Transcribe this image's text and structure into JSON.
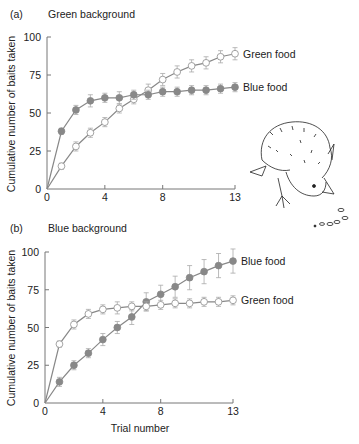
{
  "chart_data": [
    {
      "type": "line",
      "panel_label": "(a)",
      "title": "Green background",
      "xlabel": "",
      "ylabel": "Cumulative number of baits taken",
      "x": [
        0,
        1,
        2,
        3,
        4,
        5,
        6,
        7,
        8,
        9,
        10,
        11,
        12,
        13
      ],
      "xticks": [
        0,
        4,
        8,
        13
      ],
      "yticks": [
        0,
        25,
        50,
        75,
        100
      ],
      "xlim": [
        0,
        13
      ],
      "ylim": [
        0,
        100
      ],
      "grid": false,
      "series": [
        {
          "name": "Green food",
          "marker": "open-circle",
          "values": [
            0,
            15,
            28,
            37,
            44,
            53,
            59,
            65,
            72,
            77,
            81,
            83,
            87,
            89
          ],
          "error": [
            0,
            2,
            3,
            3,
            3,
            3,
            3,
            4,
            4,
            4,
            4,
            4,
            4,
            4
          ]
        },
        {
          "name": "Blue food",
          "marker": "filled-circle",
          "values": [
            0,
            38,
            52,
            58,
            60,
            60,
            62,
            62,
            64,
            64,
            65,
            65,
            66,
            67
          ],
          "error": [
            0,
            2,
            3,
            4,
            3,
            4,
            3,
            3,
            3,
            3,
            3,
            3,
            3,
            3
          ]
        }
      ],
      "legend": "inline-right"
    },
    {
      "type": "line",
      "panel_label": "(b)",
      "title": "Blue background",
      "xlabel": "Trial number",
      "ylabel": "Cumulative number of baits taken",
      "x": [
        0,
        1,
        2,
        3,
        4,
        5,
        6,
        7,
        8,
        9,
        10,
        11,
        12,
        13
      ],
      "xticks": [
        0,
        4,
        8,
        13
      ],
      "yticks": [
        0,
        25,
        50,
        75,
        100
      ],
      "xlim": [
        0,
        13
      ],
      "ylim": [
        0,
        100
      ],
      "grid": false,
      "series": [
        {
          "name": "Blue food",
          "marker": "filled-circle",
          "values": [
            0,
            14,
            25,
            33,
            42,
            50,
            57,
            67,
            72,
            77,
            83,
            87,
            91,
            94
          ],
          "error": [
            0,
            3,
            3,
            3,
            4,
            4,
            5,
            6,
            6,
            7,
            8,
            8,
            8,
            8
          ]
        },
        {
          "name": "Green food",
          "marker": "open-circle",
          "values": [
            0,
            39,
            52,
            59,
            62,
            63,
            64,
            64,
            65,
            66,
            66,
            67,
            67,
            68
          ],
          "error": [
            0,
            2,
            3,
            3,
            3,
            4,
            3,
            3,
            3,
            3,
            3,
            3,
            3,
            3
          ]
        }
      ],
      "legend": "inline-right"
    }
  ],
  "illustration": "chick-pecking-baits"
}
